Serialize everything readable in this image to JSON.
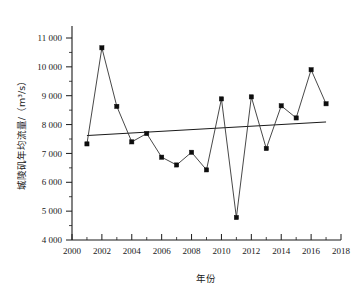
{
  "chart_data": {
    "type": "line",
    "title": "",
    "xlabel": "年份",
    "ylabel": "城陵矶年均流量/（m³/s）",
    "xlim": [
      2000,
      2018
    ],
    "ylim": [
      4000,
      11000
    ],
    "grid": false,
    "legend": null,
    "x": [
      2001,
      2002,
      2003,
      2004,
      2005,
      2006,
      2007,
      2008,
      2009,
      2010,
      2011,
      2012,
      2013,
      2014,
      2015,
      2016,
      2017
    ],
    "values": [
      7330,
      10660,
      8630,
      7400,
      7690,
      6870,
      6600,
      7040,
      6430,
      8890,
      4780,
      8960,
      7170,
      8650,
      8230,
      9900,
      8720
    ],
    "series": [
      {
        "name": "城陵矶年均流量",
        "marker": "square",
        "values": [
          7330,
          10660,
          8630,
          7400,
          7690,
          6870,
          6600,
          7040,
          6430,
          8890,
          4780,
          8960,
          7170,
          8650,
          8230,
          9900,
          8720
        ]
      },
      {
        "name": "线性趋势线",
        "marker": "none",
        "x": [
          2001,
          2017
        ],
        "values": [
          7620,
          8090
        ]
      }
    ],
    "x_tick_labels": [
      "2000",
      "2002",
      "2004",
      "2006",
      "2008",
      "2010",
      "2012",
      "2014",
      "2016",
      "2018"
    ],
    "x_tick_values": [
      2000,
      2002,
      2004,
      2006,
      2008,
      2010,
      2012,
      2014,
      2016,
      2018
    ],
    "y_tick_labels": [
      "4 000",
      "5 000",
      "6 000",
      "7 000",
      "8 000",
      "9 000",
      "10 000",
      "11 000"
    ],
    "y_tick_values": [
      4000,
      5000,
      6000,
      7000,
      8000,
      9000,
      10000,
      11000
    ]
  },
  "axis": {
    "x_title": "年份",
    "y_title": "城陵矶年均流量/（m³/s）"
  }
}
